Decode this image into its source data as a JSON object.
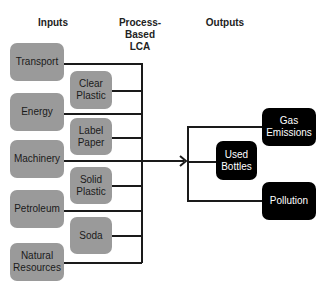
{
  "headers": {
    "inputs": "Inputs",
    "process_line1": "Process-",
    "process_line2": "Based",
    "process_line3": "LCA",
    "outputs": "Outputs"
  },
  "inputs_primary": [
    {
      "label": "Transport"
    },
    {
      "label": "Energy"
    },
    {
      "label": "Machinery"
    },
    {
      "label": "Petroleum"
    },
    {
      "label_line1": "Natural",
      "label_line2": "Resources"
    }
  ],
  "inputs_materials": [
    {
      "label_line1": "Clear",
      "label_line2": "Plastic"
    },
    {
      "label_line1": "Label",
      "label_line2": "Paper"
    },
    {
      "label_line1": "Solid",
      "label_line2": "Plastic"
    },
    {
      "label": "Soda"
    }
  ],
  "outputs": [
    {
      "label_line1": "Gas",
      "label_line2": "Emissions"
    },
    {
      "label_line1": "Used",
      "label_line2": "Bottles"
    },
    {
      "label": "Pollution"
    }
  ],
  "colors": {
    "input_box": "#9a9a9a",
    "output_box": "#000000",
    "line": "#1a1a1a"
  }
}
